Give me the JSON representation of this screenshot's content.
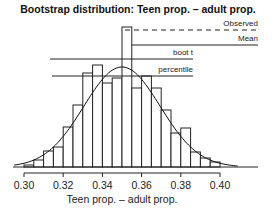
{
  "chart_data": {
    "type": "bar",
    "title": "Bootstrap distribution: Teen prop. – adult prop.",
    "xlabel": "Teen prop. – adult prop.",
    "ylabel": "",
    "xlim": [
      0.298,
      0.418
    ],
    "x_ticks": [
      0.3,
      0.32,
      0.34,
      0.36,
      0.38,
      0.4
    ],
    "x_tick_labels": [
      "0.30",
      "0.32",
      "0.34",
      "0.36",
      "0.38",
      "0.40"
    ],
    "bin_width": 0.005,
    "bins": [
      {
        "x0": 0.3,
        "x1": 0.305,
        "height": 2
      },
      {
        "x0": 0.305,
        "x1": 0.31,
        "height": 7
      },
      {
        "x0": 0.31,
        "x1": 0.315,
        "height": 16
      },
      {
        "x0": 0.315,
        "x1": 0.32,
        "height": 20
      },
      {
        "x0": 0.32,
        "x1": 0.325,
        "height": 40
      },
      {
        "x0": 0.325,
        "x1": 0.33,
        "height": 62
      },
      {
        "x0": 0.33,
        "x1": 0.335,
        "height": 94
      },
      {
        "x0": 0.335,
        "x1": 0.34,
        "height": 102
      },
      {
        "x0": 0.34,
        "x1": 0.345,
        "height": 84
      },
      {
        "x0": 0.345,
        "x1": 0.35,
        "height": 89
      },
      {
        "x0": 0.35,
        "x1": 0.355,
        "height": 140
      },
      {
        "x0": 0.355,
        "x1": 0.36,
        "height": 79
      },
      {
        "x0": 0.36,
        "x1": 0.365,
        "height": 91
      },
      {
        "x0": 0.365,
        "x1": 0.37,
        "height": 79
      },
      {
        "x0": 0.37,
        "x1": 0.375,
        "height": 57
      },
      {
        "x0": 0.375,
        "x1": 0.38,
        "height": 34
      },
      {
        "x0": 0.38,
        "x1": 0.385,
        "height": 39
      },
      {
        "x0": 0.385,
        "x1": 0.39,
        "height": 15
      },
      {
        "x0": 0.39,
        "x1": 0.395,
        "height": 9
      },
      {
        "x0": 0.395,
        "x1": 0.4,
        "height": 5
      }
    ],
    "overlay": {
      "type": "normal-curve",
      "mean": 0.35,
      "sd": 0.0195
    },
    "legend": [
      {
        "label": "Observed",
        "style": "dashed"
      },
      {
        "label": "Mean",
        "style": "solid"
      },
      {
        "label": "boot t",
        "style": "solid"
      },
      {
        "label": "percentile",
        "style": "solid"
      }
    ],
    "legend_position": "top-right",
    "grid": false
  },
  "layout": {
    "plot_left_px": 24,
    "plot_right_px": 220,
    "baseline_y_px": 167,
    "px_per_count": 1.0
  }
}
